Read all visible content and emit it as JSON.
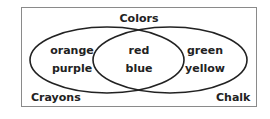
{
  "diagram": {
    "type": "venn",
    "title": "Colors",
    "sets": [
      {
        "name": "Crayons",
        "only": [
          "orange",
          "purple"
        ]
      },
      {
        "name": "Chalk",
        "only": [
          "green",
          "yellow"
        ]
      }
    ],
    "intersection": [
      "red",
      "blue"
    ]
  },
  "labels": {
    "title": "Colors",
    "left_set": "Crayons",
    "right_set": "Chalk",
    "left_1": "orange",
    "left_2": "purple",
    "mid_1": "red",
    "mid_2": "blue",
    "right_1": "green",
    "right_2": "yellow"
  }
}
